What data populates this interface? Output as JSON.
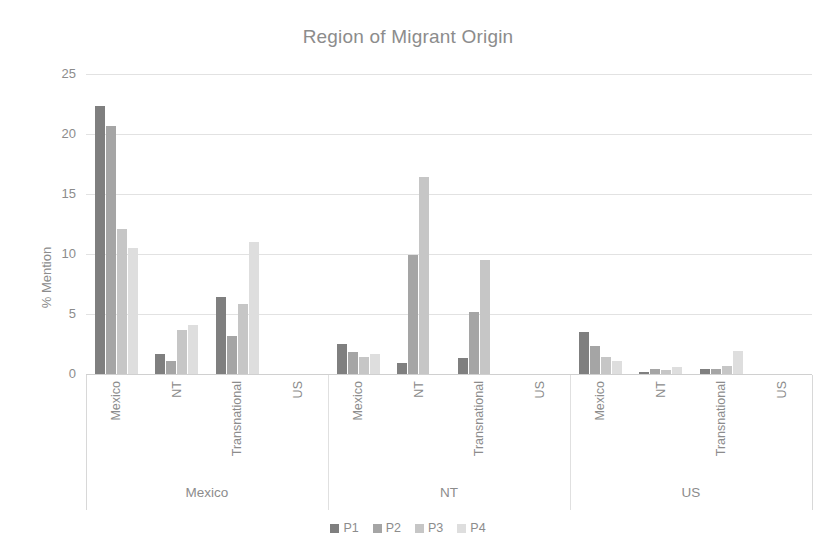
{
  "chart_data": {
    "type": "bar",
    "title": "Region of Migrant Origin",
    "xlabel": "",
    "ylabel": "% Mention",
    "ylim": [
      0,
      25
    ],
    "yticks": [
      "0",
      "5",
      "10",
      "15",
      "20",
      "25"
    ],
    "grid": true,
    "legend_position": "bottom",
    "legend": [
      "P1",
      "P2",
      "P3",
      "P4"
    ],
    "panels": [
      {
        "label": "Mexico",
        "categories": [
          "Mexico",
          "NT",
          "Transnational",
          "US"
        ],
        "series": [
          {
            "name": "P1",
            "values": [
              22.3,
              1.7,
              6.4,
              0.0
            ]
          },
          {
            "name": "P2",
            "values": [
              20.7,
              1.1,
              3.2,
              0.0
            ]
          },
          {
            "name": "P3",
            "values": [
              12.1,
              3.7,
              5.8,
              0.0
            ]
          },
          {
            "name": "P4",
            "values": [
              10.5,
              4.1,
              11.0,
              0.0
            ]
          }
        ]
      },
      {
        "label": "NT",
        "categories": [
          "Mexico",
          "NT",
          "Transnational",
          "US"
        ],
        "series": [
          {
            "name": "P1",
            "values": [
              2.5,
              0.9,
              1.3,
              0.0
            ]
          },
          {
            "name": "P2",
            "values": [
              1.8,
              9.9,
              5.2,
              0.0
            ]
          },
          {
            "name": "P3",
            "values": [
              1.4,
              16.4,
              9.5,
              0.0
            ]
          },
          {
            "name": "P4",
            "values": [
              1.7,
              0.0,
              0.0,
              0.0
            ]
          }
        ]
      },
      {
        "label": "US",
        "categories": [
          "Mexico",
          "NT",
          "Transnational",
          "US"
        ],
        "series": [
          {
            "name": "P1",
            "values": [
              3.5,
              0.2,
              0.4,
              0.0
            ]
          },
          {
            "name": "P2",
            "values": [
              2.3,
              0.4,
              0.4,
              0.0
            ]
          },
          {
            "name": "P3",
            "values": [
              1.4,
              0.3,
              0.7,
              0.0
            ]
          },
          {
            "name": "P4",
            "values": [
              1.1,
              0.6,
              1.9,
              0.0
            ]
          }
        ]
      }
    ],
    "colors": {
      "P1": "#7f7f7f",
      "P2": "#a5a5a5",
      "P3": "#c6c6c6",
      "P4": "#dedede",
      "text": "#8c8c8c",
      "grid": "#e2e2e2",
      "background": "#ffffff"
    }
  }
}
